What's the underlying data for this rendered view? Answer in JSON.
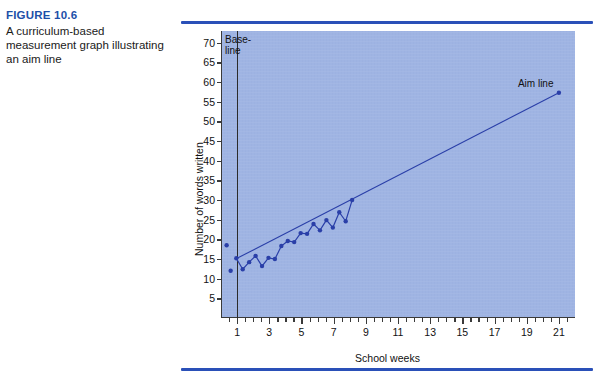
{
  "caption": {
    "figure_number": "FIGURE 10.6",
    "description": "A curriculum-based measurement graph illustrating an aim line"
  },
  "colors": {
    "rule": "#2a50b8",
    "figure_number": "#1d4fa8",
    "plot_background": "#9fb4e3",
    "data_series": "#2a3fa8",
    "aim_line": "#2a3fa8",
    "axis": "#3a3a3a"
  },
  "annotations": {
    "baseline": "Base-\nline",
    "aim_line": "Aim line"
  },
  "chart_data": {
    "type": "line",
    "title": "",
    "xlabel": "School weeks",
    "ylabel": "Number of words written",
    "xlim": [
      0,
      22
    ],
    "ylim": [
      0,
      73
    ],
    "xticks": [
      1,
      3,
      5,
      7,
      9,
      11,
      13,
      15,
      17,
      19,
      21
    ],
    "xtick_labels": [
      "1",
      "3",
      "5",
      "7",
      "9",
      "11",
      "13",
      "15",
      "17",
      "19",
      "21"
    ],
    "yticks": [
      5,
      10,
      15,
      20,
      25,
      30,
      35,
      40,
      45,
      50,
      55,
      60,
      65,
      70
    ],
    "ytick_labels": [
      "5",
      "10",
      "15",
      "20",
      "25",
      "30",
      "35",
      "40",
      "45",
      "50",
      "55",
      "60",
      "65",
      "70"
    ],
    "grid": false,
    "legend": "none",
    "baseline_week": 1,
    "series": [
      {
        "name": "Baseline scores",
        "style": "scatter",
        "x": [
          0.35,
          0.6
        ],
        "y": [
          18.5,
          12
        ]
      },
      {
        "name": "Words written",
        "style": "line-markers",
        "x": [
          0.95,
          1.35,
          1.75,
          2.15,
          2.55,
          2.95,
          3.35,
          3.75,
          4.15,
          4.55,
          4.95,
          5.35,
          5.75,
          6.15,
          6.55,
          6.95,
          7.35,
          7.75,
          8.15
        ],
        "y": [
          15.2,
          12.4,
          14.2,
          15.8,
          13.2,
          15.3,
          15.0,
          18.3,
          19.6,
          19.3,
          21.6,
          21.4,
          23.9,
          22.3,
          24.9,
          23.0,
          26.9,
          24.6,
          30.0
        ]
      },
      {
        "name": "Aim line",
        "style": "line",
        "x": [
          1,
          21
        ],
        "y": [
          15.2,
          57.3
        ]
      },
      {
        "name": "Aim line goal point",
        "style": "scatter",
        "x": [
          21
        ],
        "y": [
          57.3
        ]
      }
    ]
  }
}
